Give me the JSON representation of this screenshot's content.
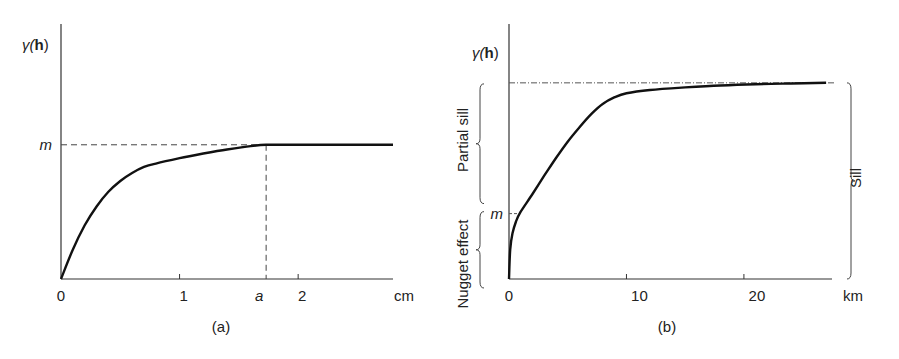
{
  "chart_data": [
    {
      "type": "line",
      "panel_label": "(a)",
      "ylabel_prefix": "γ(",
      "ylabel_bold": "h",
      "ylabel_suffix": ")",
      "xunit": "cm",
      "xlim": [
        0,
        2.8
      ],
      "ylim": [
        0,
        1.9
      ],
      "x_ticks": [
        {
          "value": 0,
          "label": "0"
        },
        {
          "value": 1,
          "label": "1"
        },
        {
          "value": 2,
          "label": "2"
        }
      ],
      "range_marker": {
        "label": "a",
        "value": 1.73
      },
      "sill_marker": {
        "label": "m",
        "value": 1.0
      },
      "series": [
        {
          "name": "variogram",
          "x": [
            0,
            0.1,
            0.2,
            0.3,
            0.4,
            0.5,
            0.6,
            0.7,
            0.8,
            1.0,
            1.2,
            1.4,
            1.6,
            1.73,
            1.9,
            2.2,
            2.5,
            2.8
          ],
          "y": [
            0,
            0.22,
            0.4,
            0.54,
            0.65,
            0.73,
            0.79,
            0.835,
            0.86,
            0.9,
            0.935,
            0.965,
            0.99,
            1.0,
            1.0,
            1.0,
            1.0,
            1.0
          ]
        }
      ]
    },
    {
      "type": "line",
      "panel_label": "(b)",
      "ylabel_prefix": "γ(",
      "ylabel_bold": "h",
      "ylabel_suffix": ")",
      "xunit": "km",
      "xlim": [
        0,
        27.5
      ],
      "ylim": [
        0,
        3.9
      ],
      "x_ticks": [
        {
          "value": 0,
          "label": "0"
        },
        {
          "value": 10,
          "label": "10"
        },
        {
          "value": 20,
          "label": "20"
        }
      ],
      "nugget_marker": {
        "label": "m",
        "value": 1.0
      },
      "sill_value": 3.0,
      "annotations": {
        "partial_sill": "Partial sill",
        "nugget_effect": "Nugget effect",
        "sill": "Sill"
      },
      "series": [
        {
          "name": "variogram",
          "x": [
            0,
            0.1,
            0.3,
            0.6,
            1.0,
            2.0,
            3.0,
            4.0,
            5.0,
            6.0,
            7.0,
            8.0,
            9.0,
            10.0,
            12.0,
            15.0,
            18.0,
            21.0,
            24.0,
            27.0
          ],
          "y": [
            0,
            0.45,
            0.7,
            0.88,
            1.03,
            1.3,
            1.58,
            1.85,
            2.1,
            2.32,
            2.52,
            2.68,
            2.78,
            2.84,
            2.89,
            2.93,
            2.96,
            2.98,
            2.99,
            3.0
          ]
        }
      ]
    }
  ]
}
